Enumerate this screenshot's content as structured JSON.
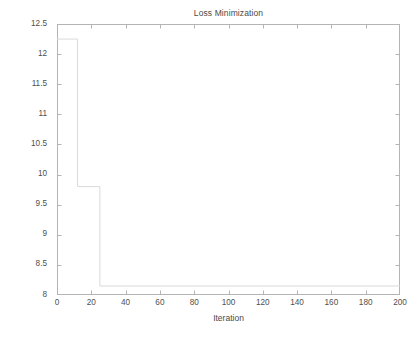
{
  "chart_data": {
    "type": "line",
    "title": "Loss Minimization",
    "xlabel": "Iteration",
    "ylabel": "Loss (MW)",
    "xlim": [
      0,
      200
    ],
    "ylim": [
      8,
      12.5
    ],
    "grid": false,
    "legend": null,
    "style": "matlab-box",
    "line_color": "#d9d9d9",
    "axis_color": "#b4b4b4",
    "text_color": "#4a4a4a",
    "xticks": [
      0,
      20,
      40,
      60,
      80,
      100,
      120,
      140,
      160,
      180,
      200
    ],
    "xtick_labels": [
      "0",
      "20",
      "40",
      "60",
      "80",
      "100",
      "120",
      "140",
      "160",
      "180",
      "200"
    ],
    "yticks": [
      8,
      8.5,
      9,
      9.5,
      10,
      10.5,
      11,
      11.5,
      12,
      12.5
    ],
    "ytick_labels": [
      "8",
      "8.5",
      "9",
      "9.5",
      "10",
      "10.5",
      "11",
      "11.5",
      "12",
      "12.5"
    ],
    "series": [
      {
        "name": "Loss",
        "drawstyle": "steps-post",
        "x": [
          0,
          12,
          12,
          25,
          25,
          200
        ],
        "y": [
          12.25,
          12.25,
          9.8,
          9.8,
          8.15,
          8.15
        ]
      }
    ],
    "plateaus": [
      {
        "from_iteration": 0,
        "to_iteration": 12,
        "loss": 12.25
      },
      {
        "from_iteration": 12,
        "to_iteration": 25,
        "loss": 9.8
      },
      {
        "from_iteration": 25,
        "to_iteration": 200,
        "loss": 8.15
      }
    ],
    "annotations": []
  }
}
